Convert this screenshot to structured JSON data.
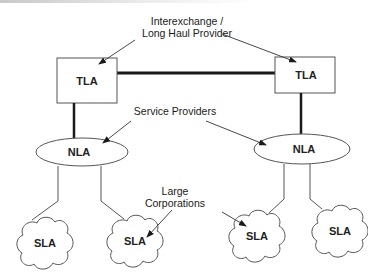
{
  "diagram": {
    "annotations": {
      "interexchange_line1": "Interexchange /",
      "interexchange_line2": "Long Haul Provider",
      "service_providers": "Service Providers",
      "large_corp_line1": "Large",
      "large_corp_line2": "Corporations"
    },
    "nodes": {
      "tla_left": "TLA",
      "tla_right": "TLA",
      "nla_left": "NLA",
      "nla_right": "NLA",
      "sla_1": "SLA",
      "sla_2": "SLA",
      "sla_3": "SLA",
      "sla_4": "SLA"
    },
    "colors": {
      "stroke": "#333333",
      "thick_link": "#1a1a1a",
      "text": "#222222"
    }
  }
}
